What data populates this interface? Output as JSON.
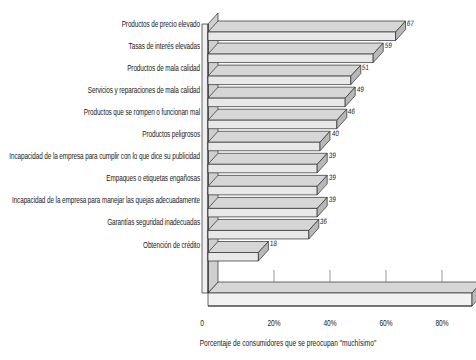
{
  "chart_data": {
    "type": "bar",
    "orientation": "horizontal",
    "style": "3d",
    "title": "",
    "xlabel": "Porcentaje de consumidores que se preocupan \"muchísimo\"",
    "ylabel": "",
    "xlim": [
      0,
      90
    ],
    "xticks": [
      0,
      20,
      40,
      60,
      80
    ],
    "xtick_labels": [
      "0",
      "20%",
      "40%",
      "60%",
      "80%"
    ],
    "grid": false,
    "legend": null,
    "categories": [
      "Productos de precio elevado",
      "Tasas de interés elevadas",
      "Productos de mala calidad",
      "Servicios y reparaciones de mala calidad",
      "Productos que se rompen o funcionan mal",
      "Productos peligrosos",
      "Incapacidad de la empresa para cumplir con lo que dice su publicidad",
      "Empaques o etiquetas engañosas",
      "Incapacidad de la empresa para manejar las quejas adecuadamente",
      "Garantías seguridad inadecuadas",
      "Obtención de crédito"
    ],
    "values": [
      67,
      59,
      51,
      49,
      46,
      40,
      39,
      39,
      39,
      36,
      18
    ],
    "value_labels": [
      "67",
      "59",
      "51",
      "49",
      "46",
      "40",
      "39",
      "39",
      "39",
      "36",
      "18"
    ],
    "colors": {
      "bar_top": "#d6d6d6",
      "bar_front": "#e8e8e8",
      "bar_side": "#b8b8b8",
      "outline": "#2b2b2b",
      "background": "#ffffff",
      "text": "#1a1a1a"
    }
  }
}
